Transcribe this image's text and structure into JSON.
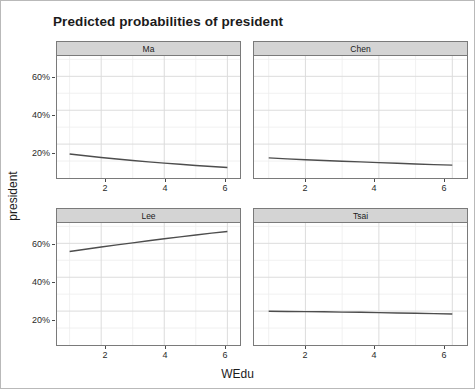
{
  "chart_data": {
    "type": "line",
    "title": "Predicted probabilities of president",
    "xlabel": "WEdu",
    "ylabel": "president",
    "xlim": [
      0.6,
      6.4
    ],
    "ylim": [
      0,
      0.72
    ],
    "grid": true,
    "legend": "none",
    "facet_layout": "2x2",
    "xticks": [
      2,
      4,
      6
    ],
    "xtick_labels": [
      "2",
      "4",
      "6"
    ],
    "yticks": [
      0.2,
      0.4,
      0.6
    ],
    "ytick_labels": [
      "20%",
      "40%",
      "60%"
    ],
    "line_color": "#4d4d4d",
    "panels": [
      {
        "name": "Ma",
        "x": [
          1,
          1.5,
          2,
          2.5,
          3,
          3.5,
          4,
          4.5,
          5,
          5.5,
          6
        ],
        "y": [
          0.142,
          0.131,
          0.121,
          0.112,
          0.103,
          0.095,
          0.088,
          0.081,
          0.074,
          0.068,
          0.062
        ]
      },
      {
        "name": "Chen",
        "x": [
          1,
          1.5,
          2,
          2.5,
          3,
          3.5,
          4,
          4.5,
          5,
          5.5,
          6
        ],
        "y": [
          0.119,
          0.113,
          0.108,
          0.103,
          0.099,
          0.095,
          0.091,
          0.087,
          0.083,
          0.079,
          0.076
        ]
      },
      {
        "name": "Lee",
        "x": [
          1,
          1.5,
          2,
          2.5,
          3,
          3.5,
          4,
          4.5,
          5,
          5.5,
          6
        ],
        "y": [
          0.552,
          0.565,
          0.578,
          0.591,
          0.603,
          0.615,
          0.627,
          0.638,
          0.649,
          0.66,
          0.67
        ]
      },
      {
        "name": "Tsai",
        "x": [
          1,
          1.5,
          2,
          2.5,
          3,
          3.5,
          4,
          4.5,
          5,
          5.5,
          6
        ],
        "y": [
          0.199,
          0.198,
          0.197,
          0.196,
          0.194,
          0.193,
          0.191,
          0.189,
          0.187,
          0.185,
          0.183
        ]
      }
    ]
  },
  "axes": {
    "ylabel": "president",
    "xlabel": "WEdu",
    "ytick_labels": [
      "60%",
      "40%",
      "20%"
    ],
    "xtick_labels": [
      "2",
      "4",
      "6"
    ]
  },
  "strips": {
    "top_left": "Ma",
    "top_right": "Chen",
    "bottom_left": "Lee",
    "bottom_right": "Tsai"
  },
  "title": "Predicted probabilities of president"
}
